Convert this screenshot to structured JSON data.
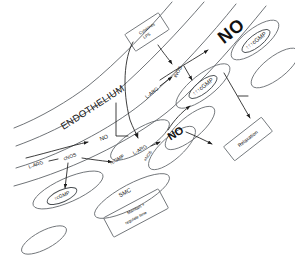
{
  "diagram": {
    "type": "hand-drawn biomedical schematic",
    "compartments": {
      "endothelium_label": "ENDOTHELIUM",
      "smc_label": "SMC"
    },
    "boxes": [
      {
        "id": "cytokines",
        "label_line1": "Cytokines",
        "label_line2": "LPS"
      },
      {
        "id": "relaxation",
        "label": "Relaxation"
      },
      {
        "id": "tone",
        "label_line1": "Maintain +",
        "label_line2": "regulate tone"
      }
    ],
    "pathways": {
      "constitutive": {
        "substrate": "L-ARG",
        "enzyme": "cNOS",
        "product": "NO",
        "second_messenger": "↑cGMP"
      },
      "inducible": {
        "substrate": "L-ARG",
        "enzyme": "iNOS",
        "product": "NO",
        "second_messenger": "↑↑↑cGMP"
      },
      "endothelial": {
        "substrate": "L-ARG",
        "enzyme": "eNOS",
        "product": "NO",
        "second_messenger": "↑cGMP"
      }
    },
    "labels": {
      "no_large": "NO",
      "no_mid": "NO",
      "no_small": "NO",
      "l_arg_left": "L-ARG",
      "cnos": "cNOS",
      "l_arg_top": "L-ARG",
      "inos": "iNOS",
      "l_arg_center": "L-ARG",
      "enos": "eNOS",
      "cgmp_up1_left": "↑cGMP",
      "cgmp_up1_center": "↑cGMP",
      "cgmp_up3_mid": "↑↑↑cGMP",
      "cgmp_up3_right": "↑↑↑cGMP"
    },
    "colors": {
      "ink": "#111111",
      "vessel": "#555a5e",
      "cell": "#6a6f73",
      "box": "#6b7074",
      "background": "#ffffff"
    }
  }
}
